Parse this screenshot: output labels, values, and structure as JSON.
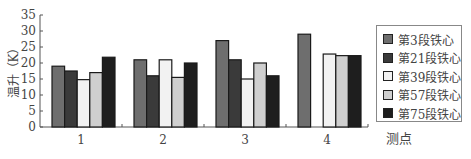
{
  "chart_data": {
    "type": "bar",
    "title": "",
    "xlabel": "测点",
    "ylabel": "温升（K）",
    "categories": [
      "1",
      "2",
      "3",
      "4"
    ],
    "ylim": [
      0,
      35
    ],
    "yticks": [
      0,
      5,
      10,
      15,
      20,
      25,
      30,
      35
    ],
    "grid": false,
    "legend_position": "right",
    "series": [
      {
        "name": "第3段铁心",
        "color": "#6e6e6e",
        "values": [
          19,
          21,
          27,
          29
        ]
      },
      {
        "name": "第21段铁心",
        "color": "#3a3a3a",
        "values": [
          17.5,
          16,
          21,
          0
        ]
      },
      {
        "name": "第39段铁心",
        "color": "#f2f2f2",
        "values": [
          14.8,
          21,
          15,
          22.8
        ]
      },
      {
        "name": "第57段铁心",
        "color": "#cfcfcf",
        "values": [
          17,
          15.5,
          20,
          22.3
        ]
      },
      {
        "name": "第75段铁心",
        "color": "#1e1e1e",
        "values": [
          21.8,
          20,
          16,
          22.3
        ]
      }
    ]
  }
}
